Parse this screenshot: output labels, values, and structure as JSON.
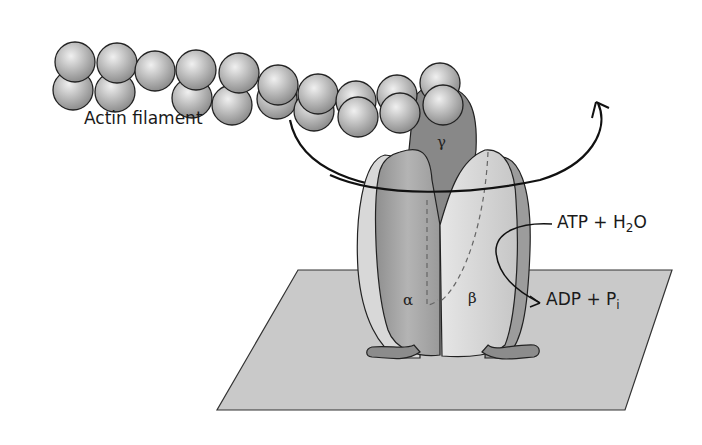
{
  "diagram": {
    "labels": {
      "actin_filament": "Actin filament",
      "gamma": "γ",
      "alpha": "α",
      "beta": "β",
      "atp_h2o_prefix": "ATP + H",
      "atp_h2o_sub": "2",
      "atp_h2o_suffix": "O",
      "adp_pi_prefix": "ADP + P",
      "adp_pi_sub": "i"
    },
    "colors": {
      "sphere": "#b8b8b8",
      "gamma_subunit": "#8a8a8a",
      "alpha_subunit": "#a0a0a0",
      "beta_subunit": "#d6d6d6",
      "membrane_plane": "#c8c8c8",
      "outline": "#1a1a1a"
    },
    "components": [
      "actin filament",
      "gamma subunit",
      "alpha subunit",
      "beta subunit",
      "membrane",
      "rotation arrow",
      "hydrolysis arrow"
    ]
  }
}
